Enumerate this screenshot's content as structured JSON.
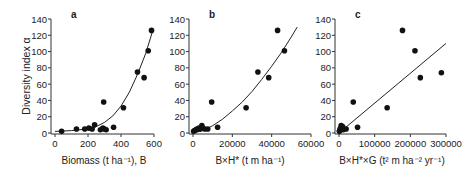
{
  "figure": {
    "ylabel": "Diversity index α"
  },
  "chart_data": [
    {
      "type": "scatter",
      "panel_label": "a",
      "xlabel": "Biomass (t ha⁻¹), B",
      "ylabel": "Diversity index α",
      "xlim": [
        0,
        600
      ],
      "ylim": [
        0,
        140
      ],
      "xticks": [
        0,
        200,
        400,
        600
      ],
      "yticks": [
        0,
        20,
        40,
        60,
        80,
        100,
        120,
        140
      ],
      "fit": "exponential",
      "points": [
        [
          40,
          2
        ],
        [
          130,
          5
        ],
        [
          180,
          5
        ],
        [
          205,
          6
        ],
        [
          225,
          5
        ],
        [
          240,
          10
        ],
        [
          275,
          4
        ],
        [
          290,
          6
        ],
        [
          295,
          38
        ],
        [
          300,
          5
        ],
        [
          310,
          4
        ],
        [
          355,
          7
        ],
        [
          415,
          31
        ],
        [
          500,
          75
        ],
        [
          540,
          68
        ],
        [
          565,
          101
        ],
        [
          585,
          126
        ]
      ],
      "curve": [
        [
          0,
          2
        ],
        [
          100,
          3
        ],
        [
          200,
          5
        ],
        [
          250,
          8
        ],
        [
          300,
          13
        ],
        [
          350,
          21
        ],
        [
          400,
          33
        ],
        [
          450,
          50
        ],
        [
          500,
          72
        ],
        [
          550,
          98
        ],
        [
          590,
          124
        ]
      ]
    },
    {
      "type": "scatter",
      "panel_label": "b",
      "xlabel": "B×H* (t m ha⁻¹)",
      "ylabel": "Diversity index α",
      "xlim": [
        0,
        60000
      ],
      "ylim": [
        0,
        140
      ],
      "xticks": [
        0,
        20000,
        40000,
        60000
      ],
      "yticks": [
        0,
        20,
        40,
        60,
        80,
        100,
        120,
        140
      ],
      "fit": "power",
      "points": [
        [
          300,
          2
        ],
        [
          800,
          3
        ],
        [
          1500,
          4
        ],
        [
          2000,
          5
        ],
        [
          3000,
          6
        ],
        [
          3500,
          5
        ],
        [
          4500,
          9
        ],
        [
          5000,
          6
        ],
        [
          6000,
          5
        ],
        [
          7500,
          5
        ],
        [
          9500,
          38
        ],
        [
          12500,
          7
        ],
        [
          27000,
          31
        ],
        [
          33000,
          75
        ],
        [
          38500,
          68
        ],
        [
          43000,
          126
        ],
        [
          46500,
          101
        ]
      ],
      "curve": [
        [
          0,
          0
        ],
        [
          5000,
          3
        ],
        [
          10000,
          9
        ],
        [
          15000,
          17
        ],
        [
          20000,
          27
        ],
        [
          25000,
          38
        ],
        [
          30000,
          51
        ],
        [
          35000,
          66
        ],
        [
          40000,
          82
        ],
        [
          45000,
          99
        ],
        [
          50000,
          118
        ],
        [
          53000,
          130
        ]
      ]
    },
    {
      "type": "scatter",
      "panel_label": "c",
      "xlabel": "B×H*×G (t² m ha⁻² yr⁻¹)",
      "ylabel": "Diversity index α",
      "xlim": [
        0,
        300000
      ],
      "ylim": [
        0,
        140
      ],
      "xticks": [
        0,
        100000,
        200000,
        300000
      ],
      "xticklabels": [
        "0",
        "100000",
        "200000",
        "300000"
      ],
      "yticks": [
        0,
        20,
        40,
        60,
        80,
        100,
        120,
        140
      ],
      "fit": "linear",
      "points": [
        [
          1000,
          2
        ],
        [
          2000,
          3
        ],
        [
          3000,
          5
        ],
        [
          5000,
          6
        ],
        [
          6000,
          9
        ],
        [
          8000,
          5
        ],
        [
          10000,
          8
        ],
        [
          12000,
          4
        ],
        [
          20000,
          5
        ],
        [
          40000,
          38
        ],
        [
          52000,
          7
        ],
        [
          135000,
          31
        ],
        [
          178000,
          126
        ],
        [
          213000,
          101
        ],
        [
          228000,
          68
        ],
        [
          287000,
          74
        ]
      ],
      "curve": [
        [
          0,
          0
        ],
        [
          300000,
          110
        ]
      ]
    }
  ]
}
